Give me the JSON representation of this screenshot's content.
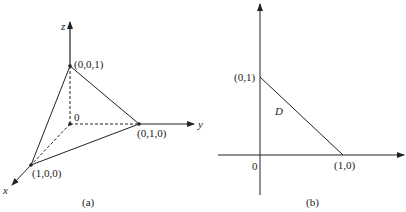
{
  "figure_a": {
    "caption": "(a)",
    "axes": {
      "x_label": "x",
      "y_label": "y",
      "z_label": "z",
      "origin_label": "0"
    },
    "points": [
      {
        "name": "z-intercept",
        "label": "(0,0,1)"
      },
      {
        "name": "y-intercept",
        "label": "(0,1,0)"
      },
      {
        "name": "x-intercept",
        "label": "(1,0,0)"
      }
    ]
  },
  "figure_b": {
    "caption": "(b)",
    "origin_label": "0",
    "region_label": "D",
    "points": [
      {
        "name": "y-intercept",
        "label": "(0,1)"
      },
      {
        "name": "x-intercept",
        "label": "(1,0)"
      }
    ]
  },
  "colors": {
    "line": "#222222",
    "background": "#ffffff"
  }
}
